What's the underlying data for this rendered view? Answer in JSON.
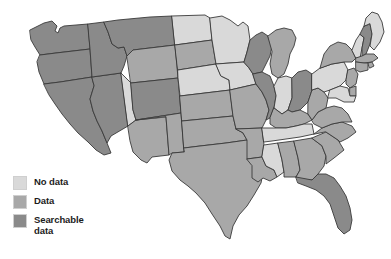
{
  "figure": {
    "type": "choropleth-map",
    "region": "United States (contiguous 48 states)",
    "background_color": "#ffffff",
    "border_color": "#3a3a3a"
  },
  "legend": {
    "items": [
      {
        "key": "no_data",
        "label": "No data",
        "color": "#d9d9d9"
      },
      {
        "key": "data",
        "label": "Data",
        "color": "#a8a8a8"
      },
      {
        "key": "searchable_data",
        "label": "Searchable\ndata",
        "color": "#8a8a8a"
      }
    ]
  },
  "chart_data": {
    "type": "heatmap",
    "title": "",
    "categories": [
      "No data",
      "Data",
      "Searchable data"
    ],
    "legend_position": "bottom-left",
    "value_colors": {
      "no_data": "#d9d9d9",
      "data": "#a8a8a8",
      "searchable_data": "#8a8a8a"
    },
    "states": [
      {
        "code": "WA",
        "name": "Washington",
        "value": "searchable_data"
      },
      {
        "code": "OR",
        "name": "Oregon",
        "value": "searchable_data"
      },
      {
        "code": "CA",
        "name": "California",
        "value": "searchable_data"
      },
      {
        "code": "NV",
        "name": "Nevada",
        "value": "searchable_data"
      },
      {
        "code": "ID",
        "name": "Idaho",
        "value": "searchable_data"
      },
      {
        "code": "MT",
        "name": "Montana",
        "value": "searchable_data"
      },
      {
        "code": "WY",
        "name": "Wyoming",
        "value": "data"
      },
      {
        "code": "UT",
        "name": "Utah",
        "value": "no_data"
      },
      {
        "code": "AZ",
        "name": "Arizona",
        "value": "data"
      },
      {
        "code": "CO",
        "name": "Colorado",
        "value": "searchable_data"
      },
      {
        "code": "NM",
        "name": "New Mexico",
        "value": "data"
      },
      {
        "code": "ND",
        "name": "North Dakota",
        "value": "no_data"
      },
      {
        "code": "SD",
        "name": "South Dakota",
        "value": "data"
      },
      {
        "code": "NE",
        "name": "Nebraska",
        "value": "no_data"
      },
      {
        "code": "KS",
        "name": "Kansas",
        "value": "data"
      },
      {
        "code": "OK",
        "name": "Oklahoma",
        "value": "data"
      },
      {
        "code": "TX",
        "name": "Texas",
        "value": "data"
      },
      {
        "code": "MN",
        "name": "Minnesota",
        "value": "no_data"
      },
      {
        "code": "IA",
        "name": "Iowa",
        "value": "no_data"
      },
      {
        "code": "MO",
        "name": "Missouri",
        "value": "data"
      },
      {
        "code": "AR",
        "name": "Arkansas",
        "value": "data"
      },
      {
        "code": "LA",
        "name": "Louisiana",
        "value": "data"
      },
      {
        "code": "WI",
        "name": "Wisconsin",
        "value": "searchable_data"
      },
      {
        "code": "IL",
        "name": "Illinois",
        "value": "searchable_data"
      },
      {
        "code": "MI",
        "name": "Michigan",
        "value": "data"
      },
      {
        "code": "IN",
        "name": "Indiana",
        "value": "no_data"
      },
      {
        "code": "OH",
        "name": "Ohio",
        "value": "searchable_data"
      },
      {
        "code": "KY",
        "name": "Kentucky",
        "value": "data"
      },
      {
        "code": "TN",
        "name": "Tennessee",
        "value": "no_data"
      },
      {
        "code": "MS",
        "name": "Mississippi",
        "value": "no_data"
      },
      {
        "code": "AL",
        "name": "Alabama",
        "value": "data"
      },
      {
        "code": "GA",
        "name": "Georgia",
        "value": "data"
      },
      {
        "code": "FL",
        "name": "Florida",
        "value": "searchable_data"
      },
      {
        "code": "SC",
        "name": "South Carolina",
        "value": "data"
      },
      {
        "code": "NC",
        "name": "North Carolina",
        "value": "data"
      },
      {
        "code": "VA",
        "name": "Virginia",
        "value": "data"
      },
      {
        "code": "WV",
        "name": "West Virginia",
        "value": "data"
      },
      {
        "code": "PA",
        "name": "Pennsylvania",
        "value": "no_data"
      },
      {
        "code": "NY",
        "name": "New York",
        "value": "data"
      },
      {
        "code": "VT",
        "name": "Vermont",
        "value": "no_data"
      },
      {
        "code": "NH",
        "name": "New Hampshire",
        "value": "searchable_data"
      },
      {
        "code": "ME",
        "name": "Maine",
        "value": "no_data"
      },
      {
        "code": "MA",
        "name": "Massachusetts",
        "value": "data"
      },
      {
        "code": "RI",
        "name": "Rhode Island",
        "value": "data"
      },
      {
        "code": "CT",
        "name": "Connecticut",
        "value": "data"
      },
      {
        "code": "NJ",
        "name": "New Jersey",
        "value": "data"
      },
      {
        "code": "DE",
        "name": "Delaware",
        "value": "data"
      },
      {
        "code": "MD",
        "name": "Maryland",
        "value": "no_data"
      }
    ]
  }
}
